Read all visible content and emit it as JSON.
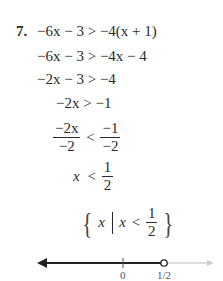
{
  "problem": {
    "number": "7.",
    "steps": [
      {
        "lhs": "−6x − 3",
        "op": ">",
        "rhs": "−4(x + 1)"
      },
      {
        "lhs": "−6x − 3",
        "op": ">",
        "rhs": "−4x − 4"
      },
      {
        "lhs": "−2x − 3",
        "op": ">",
        "rhs": "−4"
      },
      {
        "lhs": "−2x",
        "op": ">",
        "rhs": "−1"
      },
      {
        "lhs_num": "−2x",
        "lhs_den": "−2",
        "op": "<",
        "rhs_num": "−1",
        "rhs_den": "−2"
      },
      {
        "lhs": "x",
        "op": "<",
        "rhs_num": "1",
        "rhs_den": "2"
      }
    ],
    "solution_set": {
      "open_brace": "{",
      "var": "x",
      "cond_var": "x",
      "op": "<",
      "num": "1",
      "den": "2",
      "close_brace": "}"
    }
  },
  "number_line": {
    "tick_labels": [
      "0",
      "1/2"
    ],
    "endpoint": "open circle at 1/2",
    "shaded_direction": "left",
    "line_color": "#222222",
    "faint_color": "#bbbbbb"
  }
}
